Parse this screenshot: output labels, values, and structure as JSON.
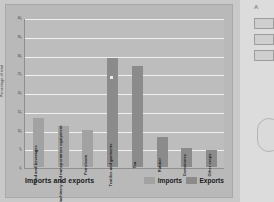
{
  "chart_data": {
    "type": "bar",
    "title": "",
    "xlabel": "Imports and exports",
    "ylabel": "Percentage of total",
    "ylim": [
      0,
      40
    ],
    "ytick_values": [
      0,
      5,
      10,
      15,
      20,
      25,
      30,
      35,
      40
    ],
    "ytick_labels": [
      "0",
      "5",
      "10",
      "15",
      "20",
      "25",
      "30",
      "35",
      "40"
    ],
    "grid": true,
    "legend_position": "bottom-right",
    "categories": [
      "Food and beverages",
      "Machinery and transportation equipment",
      "Petroleum",
      "Textiles and garments",
      "Tea",
      "Rubber",
      "Gemstones",
      "Other crops"
    ],
    "series": [
      {
        "name": "Imports",
        "color": "#a2a2a2",
        "values": [
          13,
          11,
          10,
          29,
          null,
          null,
          null,
          null
        ]
      },
      {
        "name": "Exports",
        "color": "#8b8b8b",
        "values": [
          null,
          null,
          null,
          null,
          27,
          8,
          5,
          4.5
        ]
      }
    ],
    "bars": [
      {
        "category": "Food and beverages",
        "series": "Imports",
        "value": 13
      },
      {
        "category": "Machinery and transportation equipment",
        "series": "Imports",
        "value": 11
      },
      {
        "category": "Petroleum",
        "series": "Imports",
        "value": 10
      },
      {
        "category": "Textiles and garments",
        "series": "Exports",
        "value": 29
      },
      {
        "category": "Tea",
        "series": "Exports",
        "value": 27
      },
      {
        "category": "Rubber",
        "series": "Exports",
        "value": 8
      },
      {
        "category": "Gemstones",
        "series": "Exports",
        "value": 5
      },
      {
        "category": "Other crops",
        "series": "Exports",
        "value": 4.5
      }
    ]
  },
  "legend": {
    "imports_label": "Imports",
    "exports_label": "Exports"
  },
  "side_panel": {
    "mark": "A",
    "boxes": [
      "",
      "",
      ""
    ]
  },
  "colors": {
    "imports": "#a2a2a2",
    "exports": "#8b8b8b",
    "plot_bg": "#bdbdbd",
    "card_bg": "#b9b9b9",
    "grid": "#f0f0f0"
  }
}
